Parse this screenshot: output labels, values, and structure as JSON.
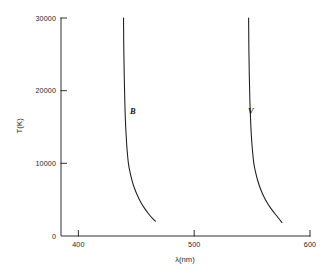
{
  "figure": {
    "background_color": "#ffffff",
    "ink_color": "#1a1a1a"
  },
  "chart_data": {
    "type": "line",
    "title": "",
    "subtitle": "",
    "xlabel": "λ(nm)",
    "ylabel": "T(K)",
    "xlim": [
      385,
      600
    ],
    "ylim": [
      0,
      30000
    ],
    "xticks": [
      400,
      500,
      600
    ],
    "xtick_labels": [
      "400",
      "500",
      "600"
    ],
    "yticks": [
      0,
      10000,
      20000,
      30000
    ],
    "ytick_labels": [
      "0",
      "10000",
      "20000",
      "30000"
    ],
    "grid": false,
    "legend": "none",
    "spines": [
      "left",
      "bottom"
    ],
    "tick_direction": "in",
    "annotations": [
      {
        "text": "B",
        "x": 452,
        "y": 17500,
        "style": "italic"
      },
      {
        "text": "V",
        "x": 560,
        "y": 17500,
        "style": "italic"
      }
    ],
    "series": [
      {
        "name": "B",
        "label": "B",
        "color": "#1a1a1a",
        "points": [
          [
            439.0,
            30000
          ],
          [
            439.1,
            28000
          ],
          [
            439.2,
            26000
          ],
          [
            439.4,
            24000
          ],
          [
            439.6,
            22000
          ],
          [
            439.9,
            20000
          ],
          [
            440.2,
            18000
          ],
          [
            440.6,
            16000
          ],
          [
            441.2,
            14000
          ],
          [
            442.0,
            12000
          ],
          [
            443.2,
            10000
          ],
          [
            444.6,
            8800
          ],
          [
            446.4,
            7600
          ],
          [
            448.6,
            6500
          ],
          [
            451.2,
            5500
          ],
          [
            454.0,
            4600
          ],
          [
            457.2,
            3800
          ],
          [
            460.4,
            3100
          ],
          [
            463.6,
            2500
          ],
          [
            466.5,
            2050
          ]
        ]
      },
      {
        "name": "V",
        "label": "V",
        "color": "#1a1a1a",
        "points": [
          [
            547.0,
            30000
          ],
          [
            547.1,
            28000
          ],
          [
            547.2,
            26000
          ],
          [
            547.4,
            24000
          ],
          [
            547.6,
            22000
          ],
          [
            547.9,
            20000
          ],
          [
            548.2,
            18000
          ],
          [
            548.7,
            16000
          ],
          [
            549.3,
            14000
          ],
          [
            550.2,
            12000
          ],
          [
            551.5,
            10000
          ],
          [
            553.0,
            8800
          ],
          [
            554.9,
            7600
          ],
          [
            557.2,
            6500
          ],
          [
            559.9,
            5500
          ],
          [
            562.9,
            4600
          ],
          [
            566.2,
            3800
          ],
          [
            569.6,
            3100
          ],
          [
            572.9,
            2450
          ],
          [
            575.8,
            1850
          ]
        ]
      }
    ]
  }
}
